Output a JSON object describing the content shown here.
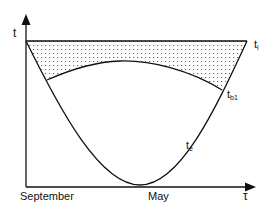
{
  "diagram": {
    "axes": {
      "y_label": "t",
      "x_label": "τ",
      "x_start_label": "September",
      "x_end_label": "May"
    },
    "curves": {
      "indoor": {
        "label": "t",
        "subscript": "i",
        "description": "indoor temperature (constant)"
      },
      "boundary": {
        "label": "t",
        "subscript": "b1",
        "description": "balance-point temperature"
      },
      "outdoor": {
        "label": "t",
        "subscript": "e",
        "description": "outdoor temperature"
      }
    },
    "shaded_region": {
      "pattern": "dotted",
      "between": [
        "indoor",
        "boundary"
      ]
    },
    "colors": {
      "line": "#111111",
      "dots": "#555555",
      "background": "#ffffff"
    }
  }
}
